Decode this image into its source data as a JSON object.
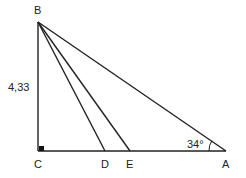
{
  "diagram": {
    "type": "geometry-triangle",
    "points": {
      "B": {
        "label": "B",
        "x": 38,
        "y": 22
      },
      "C": {
        "label": "C",
        "x": 38,
        "y": 151
      },
      "D": {
        "label": "D",
        "x": 105,
        "y": 151
      },
      "E": {
        "label": "E",
        "x": 130,
        "y": 151
      },
      "A": {
        "label": "A",
        "x": 226,
        "y": 151
      }
    },
    "segments": [
      "BC",
      "CA",
      "BA",
      "BD",
      "BE"
    ],
    "right_angle_at": "C",
    "side_label_bc": "4,33",
    "angle_label_a": "34°",
    "line_color": "#222222"
  }
}
